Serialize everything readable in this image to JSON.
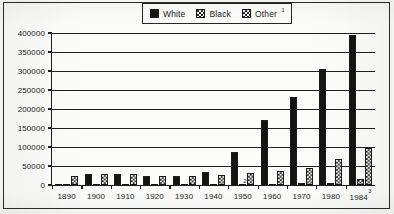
{
  "chart_data": {
    "type": "bar",
    "title": "",
    "subtitle": "",
    "xlabel": "",
    "ylabel": "",
    "ylim": [
      0,
      400000
    ],
    "ytick_values": [
      400000,
      350000,
      300000,
      250000,
      200000,
      150000,
      100000,
      50000,
      0
    ],
    "ytick_labels": [
      "400000",
      "350000",
      "300000",
      "250000",
      "200000",
      "150000",
      "100000",
      "50000",
      "0"
    ],
    "grid": true,
    "legend_position": "top-center",
    "categories": [
      "1890",
      "1900",
      "1910",
      "1920",
      "1930",
      "1940",
      "1950",
      "1960",
      "1970",
      "1980",
      "1984"
    ],
    "category_notes": {
      "1984": "3"
    },
    "series": [
      {
        "name": "White",
        "fill": "solid-black",
        "color": "#141414",
        "values": [
          2000,
          29000,
          28000,
          25000,
          24000,
          35000,
          88000,
          171000,
          231000,
          305000,
          395000
        ]
      },
      {
        "name": "Black",
        "fill": "fine-dotted",
        "color": "#fbfbfb",
        "values": [
          500,
          400,
          400,
          500,
          600,
          800,
          2000,
          2500,
          4000,
          6000,
          15000
        ],
        "point_notes": {
          "1950": "2",
          "1984": "8"
        }
      },
      {
        "name": "Other",
        "fill": "checkered",
        "color": "#efefef",
        "values": [
          25000,
          29000,
          28000,
          25000,
          25000,
          27000,
          31000,
          38000,
          46000,
          68000,
          97000
        ]
      }
    ],
    "legend_notes": {
      "Other": "1"
    }
  },
  "legend": {
    "entries": [
      {
        "label": "White",
        "sup": ""
      },
      {
        "label": "Black",
        "sup": ""
      },
      {
        "label": "Other",
        "sup": "1"
      }
    ]
  }
}
